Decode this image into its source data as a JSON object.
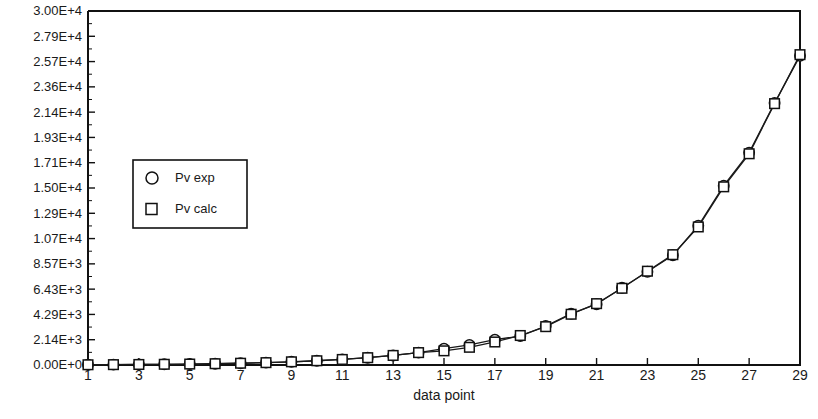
{
  "chart_data": {
    "type": "line",
    "title": "",
    "xlabel": "data point",
    "ylabel": "",
    "xlim": [
      1,
      29
    ],
    "ylim": [
      0,
      30000
    ],
    "grid": false,
    "legend_position": "upper-left-inside",
    "x": [
      1,
      2,
      3,
      4,
      5,
      6,
      7,
      8,
      9,
      10,
      11,
      12,
      13,
      14,
      15,
      16,
      17,
      18,
      19,
      20,
      21,
      22,
      23,
      24,
      25,
      26,
      27,
      28,
      29
    ],
    "x_tick_labels": [
      "1",
      "3",
      "5",
      "7",
      "9",
      "11",
      "13",
      "15",
      "17",
      "19",
      "21",
      "23",
      "25",
      "27",
      "29"
    ],
    "x_tick_values": [
      1,
      3,
      5,
      7,
      9,
      11,
      13,
      15,
      17,
      19,
      21,
      23,
      25,
      27,
      29
    ],
    "y_tick_labels": [
      "0.00E+0",
      "2.14E+3",
      "4.29E+3",
      "6.43E+3",
      "8.57E+3",
      "1.07E+4",
      "1.29E+4",
      "1.50E+4",
      "1.71E+4",
      "1.93E+4",
      "2.14E+4",
      "2.36E+4",
      "2.57E+4",
      "2.79E+4",
      "3.00E+4"
    ],
    "y_tick_values": [
      0,
      2142.86,
      4285.71,
      6428.57,
      8571.43,
      10714.3,
      12857.1,
      15000,
      17142.9,
      19285.7,
      21428.6,
      23571.4,
      25714.3,
      27857.1,
      30000
    ],
    "series": [
      {
        "name": "Pv exp",
        "marker": "circle",
        "values": [
          20,
          30,
          45,
          60,
          80,
          110,
          150,
          200,
          270,
          360,
          470,
          620,
          810,
          1050,
          1380,
          1700,
          2150,
          2450,
          3300,
          4350,
          5150,
          6550,
          7900,
          9300,
          11800,
          15200,
          18000,
          22200,
          26200
        ]
      },
      {
        "name": "Pv calc",
        "marker": "square",
        "values": [
          20,
          30,
          45,
          60,
          80,
          110,
          150,
          200,
          270,
          360,
          470,
          620,
          810,
          1050,
          1200,
          1500,
          1950,
          2500,
          3250,
          4300,
          5200,
          6500,
          7950,
          9350,
          11700,
          15100,
          17900,
          22150,
          26300
        ]
      }
    ]
  },
  "legend": {
    "items": [
      {
        "label": "Pv exp",
        "marker": "circle"
      },
      {
        "label": "Pv calc",
        "marker": "square"
      }
    ]
  }
}
